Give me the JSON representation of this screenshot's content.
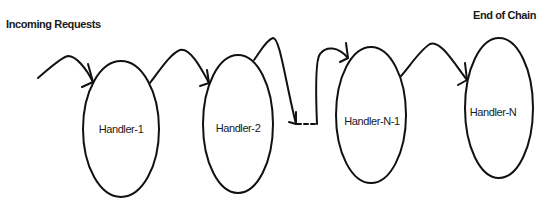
{
  "diagram": {
    "type": "chain-of-responsibility",
    "start_label": "Incoming Requests",
    "end_label": "End of Chain",
    "stroke_color": "#111111",
    "background": "#ffffff",
    "nodes": [
      {
        "id": "h1",
        "label": "Handler-1",
        "cx": 121,
        "cy": 129,
        "rx": 38,
        "ry": 68
      },
      {
        "id": "h2",
        "label": "Handler-2",
        "cx": 238,
        "cy": 124,
        "rx": 35,
        "ry": 69
      },
      {
        "id": "hn1",
        "label": "Handler-N-1",
        "cx": 371,
        "cy": 115,
        "rx": 35,
        "ry": 68
      },
      {
        "id": "hn",
        "label": "Handler-N",
        "cx": 499,
        "cy": 108,
        "rx": 34,
        "ry": 70
      }
    ],
    "edges": [
      {
        "from": "start",
        "to": "h1"
      },
      {
        "from": "h1",
        "to": "h2"
      },
      {
        "from": "h2",
        "to": "ellipsis"
      },
      {
        "from": "ellipsis",
        "to": "hn1"
      },
      {
        "from": "hn1",
        "to": "hn"
      }
    ],
    "ellipsis": "...."
  }
}
